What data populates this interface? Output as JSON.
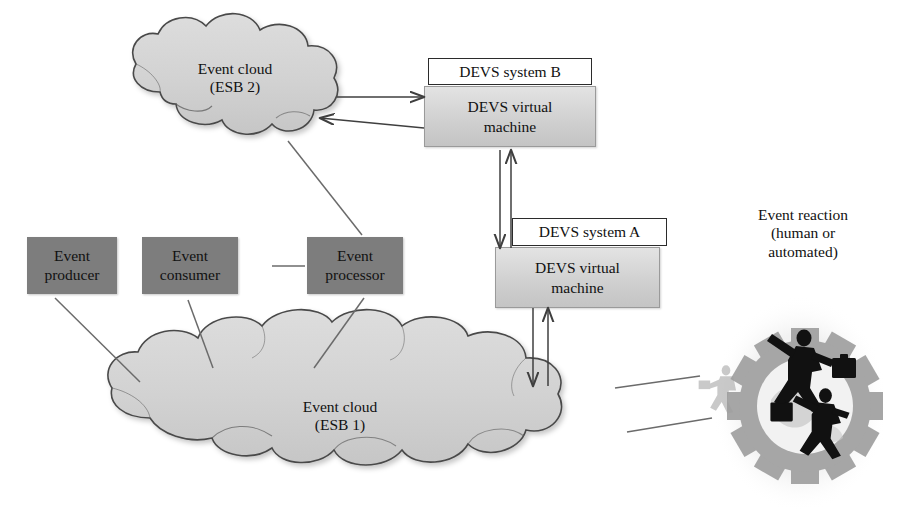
{
  "diagram": {
    "background_color": "#ffffff"
  },
  "colors": {
    "role_box_fill": "#7d7d7d",
    "cloud_fill": "#d4d4d4",
    "cloud_stroke": "#4a4a4a",
    "devs_vm_fill": "#d6d6d6",
    "devs_title_fill": "#ffffff",
    "arrow_stroke": "#6b6b6b",
    "gear_fill": "#9e9e9e",
    "figure_fill": "#111111",
    "text": "#111111"
  },
  "clouds": [
    {
      "id": "esb2",
      "line1": "Event cloud",
      "line2": "(ESB 2)"
    },
    {
      "id": "esb1",
      "line1": "Event cloud",
      "line2": "(ESB 1)"
    }
  ],
  "role_boxes": [
    {
      "id": "producer",
      "line1": "Event",
      "line2": "producer"
    },
    {
      "id": "consumer",
      "line1": "Event",
      "line2": "consumer"
    },
    {
      "id": "processor",
      "line1": "Event",
      "line2": "processor"
    }
  ],
  "devs_systems": [
    {
      "id": "devs-b",
      "title": "DEVS system B",
      "vm_line1": "DEVS virtual",
      "vm_line2": "machine"
    },
    {
      "id": "devs-a",
      "title": "DEVS system A",
      "vm_line1": "DEVS virtual",
      "vm_line2": "machine"
    }
  ],
  "reaction": {
    "line1": "Event reaction",
    "line2": "(human or",
    "line3": "automated)"
  },
  "arrows": [
    {
      "id": "esb2-to-devsb",
      "from": "Event cloud (ESB 2)",
      "to": "DEVS system B",
      "direction": "right"
    },
    {
      "id": "devsb-to-esb2",
      "from": "DEVS system B",
      "to": "Event cloud (ESB 2)",
      "direction": "left"
    },
    {
      "id": "processor-to-esb2",
      "from": "Event processor",
      "to": "Event cloud (ESB 2)",
      "direction": "up-left"
    },
    {
      "id": "consumer-to-processor",
      "from": "Event consumer",
      "to": "Event processor",
      "direction": "right"
    },
    {
      "id": "producer-to-esb1",
      "from": "Event producer",
      "to": "Event cloud (ESB 1)",
      "direction": "down-right"
    },
    {
      "id": "esb1-to-consumer",
      "from": "Event cloud (ESB 1)",
      "to": "Event consumer",
      "direction": "up-left"
    },
    {
      "id": "processor-to-esb1",
      "from": "Event processor",
      "to": "Event cloud (ESB 1)",
      "direction": "down-left"
    },
    {
      "id": "devsb-to-devsa",
      "from": "DEVS system B",
      "to": "DEVS system A",
      "direction": "down"
    },
    {
      "id": "devsa-to-devsb",
      "from": "DEVS system A",
      "to": "DEVS system B",
      "direction": "up"
    },
    {
      "id": "devsa-to-esb1",
      "from": "DEVS system A",
      "to": "Event cloud (ESB 1)",
      "direction": "down"
    },
    {
      "id": "esb1-to-devsa",
      "from": "Event cloud (ESB 1)",
      "to": "DEVS system A",
      "direction": "up"
    },
    {
      "id": "esb1-to-reaction",
      "from": "Event cloud (ESB 1)",
      "to": "Event reaction",
      "direction": "right"
    },
    {
      "id": "reaction-to-esb1",
      "from": "Event reaction",
      "to": "Event cloud (ESB 1)",
      "direction": "left"
    }
  ]
}
